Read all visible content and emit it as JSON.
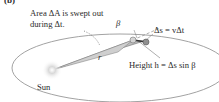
{
  "panel_label": "(b)",
  "labels": {
    "area_line1": "Area ΔA is swept out",
    "area_line2": "during Δt.",
    "beta": "β",
    "r": "r",
    "ds": "Δs = vΔt",
    "sun": "Sun",
    "height": "Height h = Δs sin β"
  },
  "colors": {
    "orbit": "#8a8a8a",
    "wedge_fill": "#b9b9b9",
    "wedge_stroke": "#6f6f6f",
    "planet": "#9a9a9a",
    "vector": "#444444",
    "sun_glow": "#d8d8d8"
  }
}
